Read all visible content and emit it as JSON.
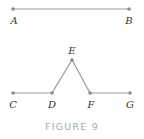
{
  "figure": {
    "caption": "FIGURE 9",
    "colors": {
      "line": "#9a9a9a",
      "point": "#8c8c8c",
      "label": "#333333",
      "caption": "#a8a8a8"
    },
    "top_segment": {
      "points": [
        {
          "label": "A",
          "x": 13,
          "y": 9
        },
        {
          "label": "B",
          "x": 129,
          "y": 9
        }
      ]
    },
    "bottom_path": {
      "points": [
        {
          "label": "C",
          "x": 13,
          "y": 93
        },
        {
          "label": "D",
          "x": 52,
          "y": 93
        },
        {
          "label": "E",
          "x": 72,
          "y": 60
        },
        {
          "label": "F",
          "x": 90,
          "y": 93
        },
        {
          "label": "G",
          "x": 130,
          "y": 93
        }
      ]
    }
  }
}
